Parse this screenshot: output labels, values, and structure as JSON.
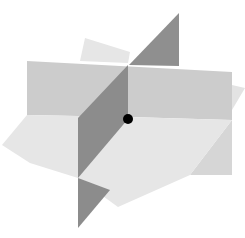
{
  "diagram": {
    "colors": {
      "background": "#ffffff",
      "horizontal_plane": "#e6e6e6",
      "back_vertical_plane": "#cccccc",
      "back_vertical_plane_lower": "#d6d6d6",
      "diagonal_vertical_plane": "#8c8c8c",
      "diagonal_vertical_plane_upper": "#8f8f8f",
      "intersection_point": "#000000"
    },
    "intersection_point": {
      "cx": 128,
      "cy": 119,
      "r": 5
    }
  }
}
